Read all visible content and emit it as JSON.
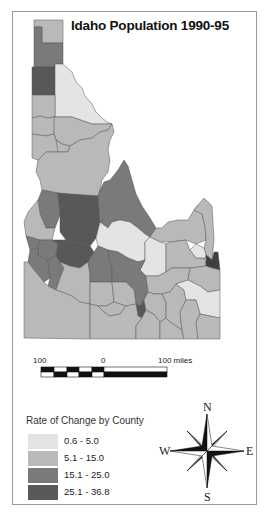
{
  "map": {
    "title": "Idaho Population 1990-95",
    "colors": {
      "class1": "#e4e4e4",
      "class2": "#b9b9b9",
      "class3": "#7a7a7a",
      "class4": "#585858",
      "border": "#4a4a4a"
    }
  },
  "scale_bar": {
    "left_label": "100",
    "center_label": "0",
    "right_label": "100 miles"
  },
  "legend": {
    "title": "Rate of Change by County",
    "items": [
      {
        "label": "0.6 - 5.0",
        "color": "#e4e4e4"
      },
      {
        "label": "5.1 -  15.0",
        "color": "#b9b9b9"
      },
      {
        "label": "15.1 - 25.0",
        "color": "#7a7a7a"
      },
      {
        "label": "25.1 - 36.8",
        "color": "#585858"
      }
    ]
  },
  "compass": {
    "north": "N",
    "south": "S",
    "east": "E",
    "west": "W"
  }
}
